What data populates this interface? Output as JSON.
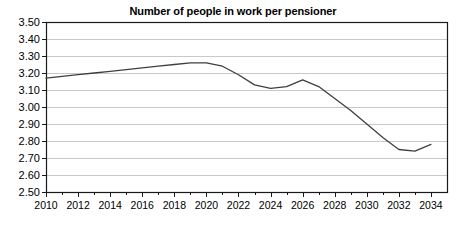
{
  "chart_data": {
    "type": "line",
    "title": "Number of people in work per pensioner",
    "xlabel": "",
    "ylabel": "",
    "grid": true,
    "legend": "none",
    "xlim": [
      2010,
      2035
    ],
    "ylim": [
      2.5,
      3.5
    ],
    "y_ticks": [
      "3.50",
      "3.40",
      "3.30",
      "3.20",
      "3.10",
      "3.00",
      "2.90",
      "2.80",
      "2.70",
      "2.60",
      "2.50"
    ],
    "y_tick_values": [
      3.5,
      3.4,
      3.3,
      3.2,
      3.1,
      3.0,
      2.9,
      2.8,
      2.7,
      2.6,
      2.5
    ],
    "x_ticks": [
      "2010",
      "2012",
      "2014",
      "2016",
      "2018",
      "2020",
      "2022",
      "2024",
      "2026",
      "2028",
      "2030",
      "2032",
      "2034"
    ],
    "x_tick_values": [
      2010,
      2012,
      2014,
      2016,
      2018,
      2020,
      2022,
      2024,
      2026,
      2028,
      2030,
      2032,
      2034
    ],
    "x_minor_step": 1,
    "series": [
      {
        "name": "People in work per pensioner",
        "color": "#3f3f3f",
        "x": [
          2010,
          2011,
          2012,
          2013,
          2014,
          2015,
          2016,
          2017,
          2018,
          2019,
          2020,
          2021,
          2022,
          2023,
          2024,
          2025,
          2026,
          2027,
          2028,
          2029,
          2030,
          2031,
          2032,
          2033,
          2034
        ],
        "values": [
          3.17,
          3.18,
          3.19,
          3.2,
          3.21,
          3.22,
          3.23,
          3.24,
          3.25,
          3.26,
          3.26,
          3.24,
          3.19,
          3.13,
          3.11,
          3.12,
          3.16,
          3.12,
          3.05,
          2.98,
          2.9,
          2.82,
          2.75,
          2.74,
          2.78
        ]
      }
    ],
    "colors": {
      "line": "#3f3f3f",
      "grid": "#c8c8c8",
      "axis": "#1a1a1a",
      "text": "#000000",
      "background": "#ffffff"
    }
  }
}
